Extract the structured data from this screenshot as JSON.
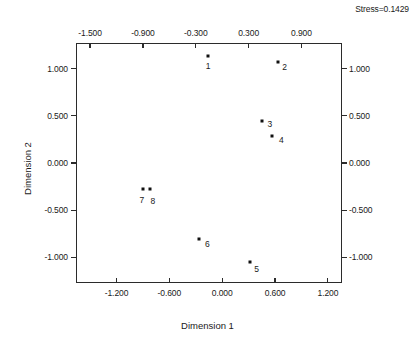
{
  "annotation": {
    "stress": "Stress=0.1429"
  },
  "chart_data": {
    "type": "scatter",
    "title": "",
    "subtitle": "",
    "xlabel": "Dimension 1",
    "ylabel": "Dimension 2",
    "xlim": [
      -1.66,
      1.36
    ],
    "ylim": [
      -1.27,
      1.27
    ],
    "grid": false,
    "legend": "none",
    "annotations": [
      "Stress=0.1429"
    ],
    "axis_ticks": {
      "x_top": [
        "-1.500",
        "-0.900",
        "-0.300",
        "0.300",
        "0.900"
      ],
      "x_top_values": [
        -1.5,
        -0.9,
        -0.3,
        0.3,
        0.9
      ],
      "x_bottom": [
        "-1.200",
        "-0.600",
        "0.000",
        "0.600",
        "1.200"
      ],
      "x_bottom_values": [
        -1.2,
        -0.6,
        0.0,
        0.6,
        1.2
      ],
      "y_left": [
        "1.000",
        "0.500",
        "0.000",
        "-0.500",
        "-1.000"
      ],
      "y_left_values": [
        1.0,
        0.5,
        0.0,
        -0.5,
        -1.0
      ],
      "y_right": [
        "1.000",
        "0.500",
        "0.000",
        "-0.500",
        "-1.000"
      ],
      "y_right_values": [
        1.0,
        0.5,
        0.0,
        -0.5,
        -1.0
      ]
    },
    "points": [
      {
        "label": "1",
        "x": -0.16,
        "y": 1.13,
        "label_dx": 0,
        "label_dy": 10
      },
      {
        "label": "2",
        "x": 0.63,
        "y": 1.07,
        "label_dx": 7,
        "label_dy": 5
      },
      {
        "label": "3",
        "x": 0.45,
        "y": 0.44,
        "label_dx": 8,
        "label_dy": 3
      },
      {
        "label": "4",
        "x": 0.57,
        "y": 0.29,
        "label_dx": 9,
        "label_dy": 4
      },
      {
        "label": "5",
        "x": 0.31,
        "y": -1.05,
        "label_dx": 7,
        "label_dy": 7
      },
      {
        "label": "6",
        "x": -0.26,
        "y": -0.8,
        "label_dx": 8,
        "label_dy": 5
      },
      {
        "label": "7",
        "x": -0.9,
        "y": -0.28,
        "label_dx": -1,
        "label_dy": 11
      },
      {
        "label": "8",
        "x": -0.82,
        "y": -0.27,
        "label_dx": 3,
        "label_dy": 12
      }
    ]
  }
}
